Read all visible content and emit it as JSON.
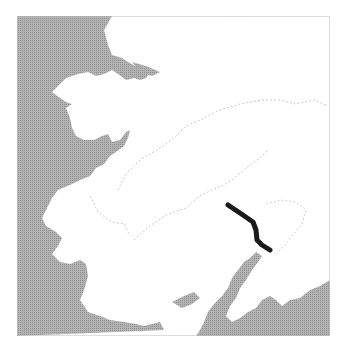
{
  "map": {
    "colors": {
      "water": "#a9a9a9",
      "land": "#ffffff",
      "border": "#c8c8c8",
      "frame": "#bdbdbd",
      "route": "#1a1a1a"
    },
    "route": {
      "points": [
        [
          228,
          205
        ],
        [
          240,
          213
        ],
        [
          253,
          222
        ],
        [
          256,
          230
        ],
        [
          257,
          240
        ],
        [
          262,
          245
        ],
        [
          270,
          250
        ]
      ]
    }
  }
}
